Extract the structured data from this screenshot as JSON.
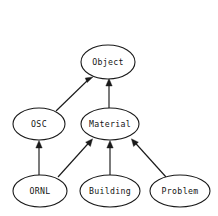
{
  "diagram": {
    "background_color": "#ffffff",
    "stroke_color": "#1a1a1a",
    "text_color": "#141414",
    "width": 218,
    "height": 216,
    "node_shape": "ellipse",
    "edge_style": "solid-arrow",
    "direction": "bottom-up"
  },
  "nodes": [
    {
      "id": "object",
      "label": "Object",
      "cx": 108,
      "cy": 62,
      "rx": 27,
      "ry": 17,
      "level": 0
    },
    {
      "id": "osc",
      "label": "OSC",
      "cx": 39,
      "cy": 124,
      "rx": 26,
      "ry": 16,
      "level": 1
    },
    {
      "id": "material",
      "label": "Material",
      "cx": 110,
      "cy": 124,
      "rx": 29,
      "ry": 16,
      "level": 1
    },
    {
      "id": "ornl",
      "label": "ORNL",
      "cx": 40,
      "cy": 191,
      "rx": 27,
      "ry": 16,
      "level": 2
    },
    {
      "id": "building",
      "label": "Building",
      "cx": 110,
      "cy": 191,
      "rx": 30,
      "ry": 16,
      "level": 2
    },
    {
      "id": "problem",
      "label": "Problem",
      "cx": 180,
      "cy": 191,
      "rx": 30,
      "ry": 16,
      "level": 2
    }
  ],
  "edges": [
    {
      "id": "osc-object",
      "from": "OSC",
      "to": "Object",
      "x1": 56,
      "y1": 111,
      "x2": 88,
      "y2": 77
    },
    {
      "id": "material-object",
      "from": "Material",
      "to": "Object",
      "x1": 109,
      "y1": 108,
      "x2": 109,
      "y2": 80
    },
    {
      "id": "ornl-osc",
      "from": "ORNL",
      "to": "OSC",
      "x1": 39,
      "y1": 175,
      "x2": 39,
      "y2": 141
    },
    {
      "id": "ornl-material",
      "from": "ORNL",
      "to": "Material",
      "x1": 58,
      "y1": 177,
      "x2": 89,
      "y2": 139
    },
    {
      "id": "building-material",
      "from": "Building",
      "to": "Material",
      "x1": 110,
      "y1": 175,
      "x2": 110,
      "y2": 141
    },
    {
      "id": "problem-material",
      "from": "Problem",
      "to": "Material",
      "x1": 166,
      "y1": 177,
      "x2": 134,
      "y2": 139
    }
  ]
}
